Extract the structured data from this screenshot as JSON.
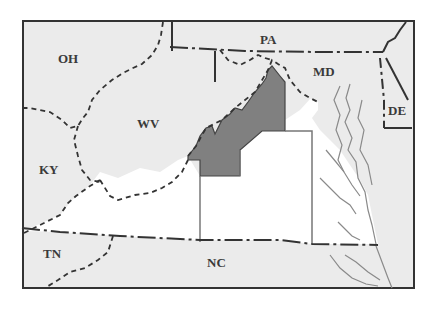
{
  "map": {
    "colors": {
      "background_land": "#ebebeb",
      "virginia": "#ffffff",
      "shaded_region": "#808080",
      "border": "#333333",
      "water_lines": "#8a8a8a"
    },
    "labels": {
      "oh": "OH",
      "pa": "PA",
      "md": "MD",
      "de": "DE",
      "wv": "WV",
      "ky": "KY",
      "tn": "TN",
      "nc": "NC"
    }
  }
}
